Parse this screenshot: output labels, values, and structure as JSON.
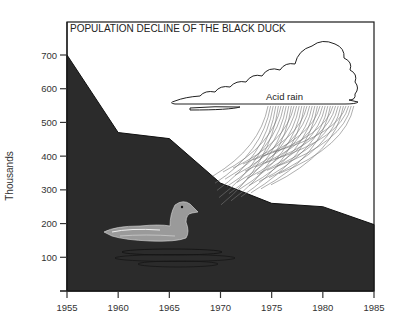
{
  "chart_data": {
    "type": "area",
    "title": "POPULATION DECLINE OF THE BLACK DUCK",
    "xlabel": "",
    "ylabel": "Thousands",
    "x": [
      1955,
      1960,
      1965,
      1970,
      1975,
      1980,
      1985
    ],
    "values": [
      700,
      470,
      452,
      320,
      260,
      250,
      197
    ],
    "series": [
      {
        "name": "Black duck population",
        "values": [
          700,
          470,
          452,
          320,
          260,
          250,
          197
        ]
      }
    ],
    "xlim": [
      1955,
      1985
    ],
    "ylim": [
      0,
      700
    ],
    "x_ticks": [
      "1955",
      "1960",
      "1965",
      "1970",
      "1975",
      "1980",
      "1985"
    ],
    "y_ticks": [
      "100",
      "200",
      "300",
      "400",
      "500",
      "600",
      "700"
    ],
    "grid": false,
    "legend": "none",
    "annotations": [
      {
        "text": "Acid rain",
        "kind": "cloud-illustration"
      },
      {
        "text": "",
        "kind": "duck-illustration"
      }
    ],
    "colors": {
      "fill": "#2b2b2b",
      "frame": "#1a1a1a",
      "background": "#ffffff"
    }
  }
}
